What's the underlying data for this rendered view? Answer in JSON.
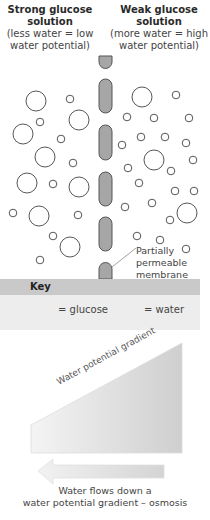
{
  "headers": {
    "left": {
      "title_line1": "Strong glucose",
      "title_line2": "solution",
      "sub_line1": "(less water = low",
      "sub_line2": "water potential)"
    },
    "right": {
      "title_line1": "Weak glucose",
      "title_line2": "solution",
      "sub_line1": "(more water = high",
      "sub_line2": "water potential)"
    }
  },
  "membrane": {
    "label_line1": "Partially",
    "label_line2": "permeable",
    "label_line3": "membrane",
    "fill_color": "#a6a6a6",
    "stroke_color": "#555555"
  },
  "key": {
    "title": "Key",
    "glucose_label": "= glucose",
    "water_label": "= water",
    "bar_color": "#c9c9c9",
    "body_color": "#ededed"
  },
  "gradient": {
    "label": "Water potential gradient"
  },
  "arrow": {
    "caption_line1": "Water flows down a",
    "caption_line2": "water potential gradient – osmosis"
  }
}
